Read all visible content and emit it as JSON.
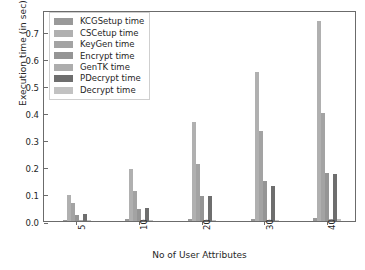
{
  "chart_data": {
    "type": "bar",
    "title": "",
    "xlabel": "No of User Attributes",
    "ylabel": "Execution time (in sec)",
    "categories": [
      "5",
      "10",
      "20",
      "30",
      "40"
    ],
    "ylim": [
      0.0,
      0.78
    ],
    "yticks": [
      "0.0",
      "0.1",
      "0.2",
      "0.3",
      "0.4",
      "0.5",
      "0.6",
      "0.7"
    ],
    "ytick_values": [
      0.0,
      0.1,
      0.2,
      0.3,
      0.4,
      0.5,
      0.6,
      0.7
    ],
    "grid": false,
    "legend_position": "upper left",
    "series": [
      {
        "name": "KCGSetup time",
        "color": "#999999",
        "values": [
          0.004,
          0.006,
          0.007,
          0.009,
          0.01
        ]
      },
      {
        "name": "CSCetup time",
        "color": "#b0b0b0",
        "values": [
          0.096,
          0.192,
          0.365,
          0.55,
          0.74
        ]
      },
      {
        "name": "KeyGen time",
        "color": "#a3a3a3",
        "values": [
          0.066,
          0.112,
          0.212,
          0.332,
          0.401
        ]
      },
      {
        "name": "Encrypt time",
        "color": "#959595",
        "values": [
          0.022,
          0.046,
          0.091,
          0.148,
          0.176
        ]
      },
      {
        "name": "GenTK time",
        "color": "#adadad",
        "values": [
          0.002,
          0.003,
          0.004,
          0.005,
          0.006
        ]
      },
      {
        "name": "PDecrypt time",
        "color": "#6e6e6e",
        "values": [
          0.026,
          0.048,
          0.092,
          0.131,
          0.172
        ]
      },
      {
        "name": "Decrypt time",
        "color": "#c2c2c2",
        "values": [
          0.002,
          0.003,
          0.004,
          0.005,
          0.006
        ]
      }
    ]
  },
  "axes": {
    "frame_color": "#6b6b6b"
  }
}
